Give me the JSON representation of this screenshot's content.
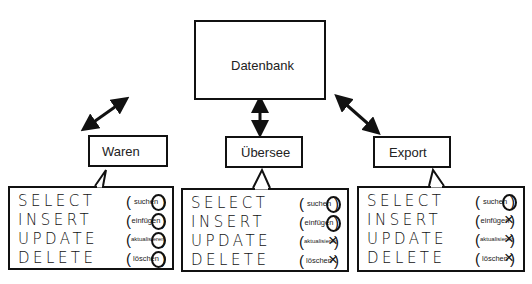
{
  "database": {
    "label": "Datenbank"
  },
  "roles": [
    {
      "name": "Waren",
      "permissions": [
        {
          "command": "SELECT",
          "meaning": "suchen",
          "allowed": true,
          "mark": "O"
        },
        {
          "command": "INSERT",
          "meaning": "einfügen",
          "allowed": true,
          "mark": "O"
        },
        {
          "command": "UPDATE",
          "meaning": "aktualisieren",
          "allowed": true,
          "mark": "O"
        },
        {
          "command": "DELETE",
          "meaning": "löschen",
          "allowed": true,
          "mark": "O"
        }
      ]
    },
    {
      "name": "Übersee",
      "permissions": [
        {
          "command": "SELECT",
          "meaning": "suchen",
          "allowed": true,
          "mark": "O"
        },
        {
          "command": "INSERT",
          "meaning": "einfügen",
          "allowed": true,
          "mark": "O"
        },
        {
          "command": "UPDATE",
          "meaning": "aktualisieren",
          "allowed": false,
          "mark": "×"
        },
        {
          "command": "DELETE",
          "meaning": "löschen",
          "allowed": false,
          "mark": "×"
        }
      ]
    },
    {
      "name": "Export",
      "permissions": [
        {
          "command": "SELECT",
          "meaning": "suchen",
          "allowed": true,
          "mark": "O"
        },
        {
          "command": "INSERT",
          "meaning": "einfügen",
          "allowed": false,
          "mark": "×"
        },
        {
          "command": "UPDATE",
          "meaning": "aktualisieren",
          "allowed": false,
          "mark": "×"
        },
        {
          "command": "DELETE",
          "meaning": "löschen",
          "allowed": false,
          "mark": "×"
        }
      ]
    }
  ],
  "paren_open": "(",
  "paren_close": ")"
}
